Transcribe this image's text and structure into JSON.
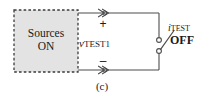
{
  "figure": {
    "caption": "(c)",
    "width": 203,
    "height": 102,
    "background_color": "#ffffff"
  },
  "source_block": {
    "label_line1": "Sources",
    "label_line2": "ON",
    "fill_color": "#e3e3e3",
    "border_style": "dashed",
    "border_color": "#3a3a3a",
    "x": 14,
    "y": 10,
    "width": 64,
    "height": 62
  },
  "terminals": {
    "positive": {
      "sign": "+",
      "marker": "arrowhead-terminal-icon",
      "x": 103,
      "y": 13
    },
    "negative": {
      "sign": "–",
      "marker": "arrowhead-terminal-icon",
      "x": 103,
      "y": 70
    }
  },
  "labels": {
    "voltage_symbol": "v",
    "voltage_subscript": "TEST1",
    "current_symbol": "i",
    "current_subscript": "TEST",
    "switch_state": "OFF"
  },
  "switch": {
    "name": "test-current-switch",
    "state": "open",
    "contact_top": {
      "x": 159,
      "y": 40
    },
    "contact_bottom": {
      "x": 159,
      "y": 51
    },
    "blade_tip": {
      "x": 172,
      "y": 32
    },
    "contact_radius": 2.4
  },
  "wires": {
    "stroke_color": "#4d4d4d",
    "stroke_width": 1.1,
    "top_y": 13,
    "bottom_y": 70,
    "left_x": 78,
    "right_x": 159
  },
  "colors": {
    "line": "#4d4d4d",
    "text": "#1a1a1a",
    "block_fill": "#e3e3e3",
    "block_border": "#3a3a3a"
  }
}
